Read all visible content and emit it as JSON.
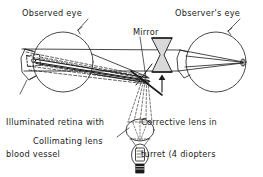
{
  "figure": {
    "background_color": "#ffffff",
    "ink_color": "#1b1b1b",
    "width": 263,
    "height": 177
  },
  "labels": {
    "observed_eye": "Observed eye",
    "observers_eye": "Observer's eye",
    "mirror": "Mirror",
    "illuminated_retina_line1": "Illuminated retina with",
    "illuminated_retina_line2": "blood vessel",
    "corrective_lens_line1": "Corrective lens in",
    "corrective_lens_line2": "turret (4 diopters",
    "corrective_lens_line3": "for normal eyes)",
    "collimating_lens": "Collimating lens"
  },
  "components": {
    "observed_eye": {
      "name": "observed-eye",
      "shape": "circle-with-cornea",
      "cx": 63,
      "cy": 62,
      "r": 30
    },
    "observers_eye": {
      "name": "observers-eye",
      "shape": "circle-with-cornea",
      "cx": 216,
      "cy": 62,
      "r": 30
    },
    "mirror": {
      "name": "mirror",
      "shape": "diagonal-line"
    },
    "corrective_lens": {
      "name": "corrective-lens",
      "shape": "biconcave-lens"
    },
    "collimating_lens": {
      "name": "collimating-lens",
      "shape": "ellipse"
    },
    "lamp": {
      "name": "lamp",
      "shape": "bulb-with-base"
    },
    "retina_target": {
      "name": "retina-target",
      "shape": "small-rectangle"
    }
  }
}
